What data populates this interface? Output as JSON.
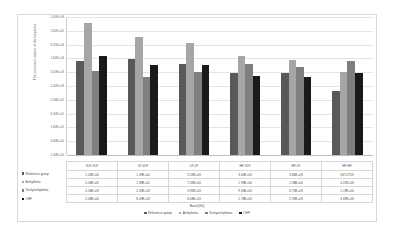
{
  "chart_data": {
    "type": "bar",
    "title": "",
    "xlabel": "Band [Hz]",
    "ylabel": "The maximum values of the bispectra",
    "categories": [
      "VLF-VLF",
      "LF-VLF",
      "LF-LF",
      "HF-VLF",
      "HF-LF",
      "HF-HF"
    ],
    "yscale": "log",
    "ylim": [
      1.0,
      1000000.0
    ],
    "ytick_labels": [
      "1.00E+06",
      "2.62E+05",
      "6.55E+04",
      "1.64E+04",
      "4.10E+03",
      "1.02E+03",
      "2.56E+02",
      "6.40E+01",
      "1.60E+01",
      "4.00E+00",
      "1.00E+00"
    ],
    "grid": true,
    "legend_position": "bottom",
    "series": [
      {
        "name": "Reference group",
        "color": "#595959",
        "values": [
          12400,
          14900,
          9230,
          3600,
          3840,
          637.0753
        ],
        "labels": [
          "1.24E+04",
          "1.49E+04",
          "9.23E+03",
          "3.60E+03",
          "3.84E+03",
          "637.0753"
        ]
      },
      {
        "name": "Arrhythmia",
        "color": "#a6a6a6",
        "values": [
          534000,
          138000,
          73300,
          19800,
          13800,
          4220
        ],
        "labels": [
          "5.34E+05",
          "1.38E+05",
          "7.33E+04",
          "1.98E+04",
          "1.38E+04",
          "4.22E+03"
        ]
      },
      {
        "name": "Tachyarrhythmia",
        "color": "#7f7f7f",
        "values": [
          4560,
          2350,
          3920,
          9350,
          6730,
          11900
        ],
        "labels": [
          "4.56E+03",
          "2.35E+03",
          "3.92E+03",
          "9.35E+03",
          "6.73E+03",
          "1.19E+04"
        ]
      },
      {
        "name": "CHF",
        "color": "#1a1a1a",
        "values": [
          20800,
          8090,
          8080,
          2780,
          2590,
          3690
        ],
        "labels": [
          "2.08E+04",
          "8.09E+03",
          "8.08E+03",
          "2.78E+03",
          "2.59E+03",
          "3.69E+03"
        ]
      }
    ]
  },
  "table": {
    "row_labels": [
      "Reference group",
      "Arrhythmia",
      "Tachyarrhythmia",
      "CHF"
    ]
  }
}
